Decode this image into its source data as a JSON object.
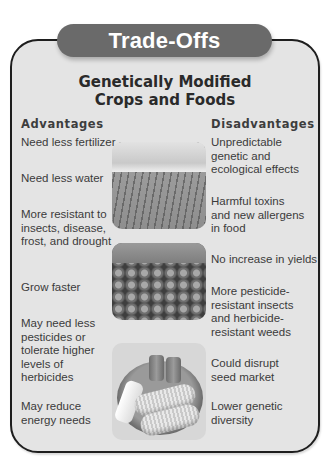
{
  "header": {
    "title": "Trade-Offs",
    "subtitle_line1": "Genetically Modified",
    "subtitle_line2": "Crops and Foods"
  },
  "columns": {
    "advantages": {
      "heading": "Advantages",
      "items": [
        "Need less fertilizer",
        "Need less water",
        "More resistant to insects, disease, frost, and drought",
        "Grow faster",
        "May need less pesticides or tolerate higher levels of herbicides",
        "May reduce energy needs"
      ]
    },
    "disadvantages": {
      "heading": "Disadvantages",
      "items": [
        "Unpredictable genetic and ecological effects",
        "Harmful toxins and new allergens in food",
        "No increase in yields",
        "More pesticide-resistant insects and herbicide-resistant weeds",
        "Could disrupt seed market",
        "Lower genetic diversity"
      ]
    }
  },
  "images": [
    {
      "name": "crop-field-photo",
      "description": "Plowed crop field rows under cloudy sky"
    },
    {
      "name": "tomatoes-photo",
      "description": "Rows of tomatoes in crates"
    },
    {
      "name": "corn-plate-photo",
      "description": "Corn on the cob with butter and salt and pepper shakers on a plate"
    }
  ],
  "colors": {
    "pill_bg": "#6a6a6a",
    "panel_bg": "#e4e4e4",
    "border": "#1e1e1e",
    "title_text": "#ffffff"
  }
}
